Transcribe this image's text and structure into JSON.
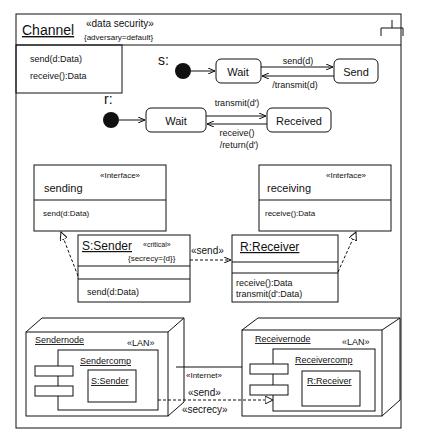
{
  "package": {
    "name": "Channel",
    "stereotype": "«data security»",
    "tag": "{adversary=default}",
    "operations": [
      "send(d:Data)",
      "receive():Data"
    ]
  },
  "statechart_s": {
    "label": "s:",
    "states": [
      "Wait",
      "Send"
    ],
    "transition_forward": "send(d)",
    "transition_back": "/transmit(d)"
  },
  "statechart_r": {
    "label": "r:",
    "states": [
      "Wait",
      "Received"
    ],
    "transition_forward": "transmit(d')",
    "transition_back_1": "receive()",
    "transition_back_2": "/return(d')"
  },
  "interfaces": {
    "sending": {
      "stereotype": "«Interface»",
      "name": "sending",
      "operation": "send(d:Data)"
    },
    "receiving": {
      "stereotype": "«Interface»",
      "name": "receiving",
      "operation": "receive():Data"
    }
  },
  "classes": {
    "sender": {
      "name": "S:Sender",
      "stereotype": "«critical»",
      "tag": "{secrecy={d}}",
      "operations": [
        "send(d:Data)"
      ]
    },
    "receiver": {
      "name": "R:Receiver",
      "operations": [
        "receive():Data",
        "transmit(d':Data)"
      ]
    },
    "send_dependency": "«send»"
  },
  "deployment": {
    "sendernode": {
      "name": "Sendernode",
      "stereotype": "«LAN»",
      "component": "Sendercomp",
      "object": "S:Sender"
    },
    "receivernode": {
      "name": "Receivernode",
      "stereotype": "«LAN»",
      "component": "Receivercomp",
      "object": "R:Receiver"
    },
    "link_stereotypes": [
      "«Internet»",
      "«send»",
      "«secrecy»"
    ]
  }
}
